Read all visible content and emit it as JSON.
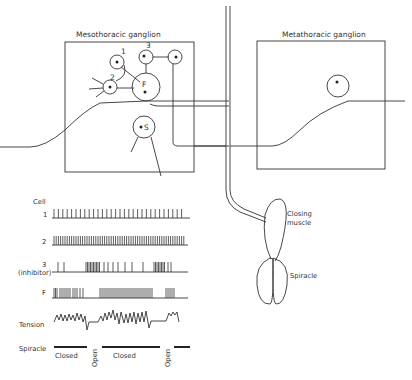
{
  "diagram": {
    "ganglia": [
      {
        "id": "meso",
        "label": "Mesothoracic ganglion"
      },
      {
        "id": "meta",
        "label": "Metathoracic ganglion"
      }
    ],
    "neurons": [
      {
        "id": "1",
        "label": "1"
      },
      {
        "id": "2",
        "label": "2"
      },
      {
        "id": "3",
        "label": "3"
      },
      {
        "id": "F",
        "label": "F"
      },
      {
        "id": "S",
        "label": "S"
      }
    ],
    "structures": {
      "muscle_label_line1": "Closing",
      "muscle_label_line2": "muscle",
      "spiracle_label": "Spiracle"
    },
    "traces": {
      "header": "Cell",
      "rows": [
        {
          "label": "1",
          "sublabel": ""
        },
        {
          "label": "2",
          "sublabel": ""
        },
        {
          "label": "3",
          "sublabel": "(inhibitor)"
        },
        {
          "label": "F",
          "sublabel": ""
        },
        {
          "label": "Tension",
          "sublabel": ""
        },
        {
          "label": "Spiracle",
          "sublabel": ""
        }
      ],
      "spiracle_states": [
        {
          "label": "Closed"
        },
        {
          "label": "Open"
        },
        {
          "label": "Closed"
        },
        {
          "label": "Open"
        }
      ]
    }
  }
}
